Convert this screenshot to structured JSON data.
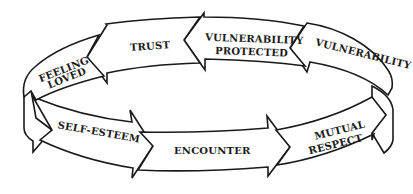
{
  "diagram": {
    "type": "cycle",
    "direction": "clockwise-loop",
    "stroke_color": "#1a1a1a",
    "fill_color": "#ffffff",
    "stages": [
      {
        "id": "vulnerability",
        "label": "VULNERABILITY",
        "band": "top",
        "arrow_direction": "left"
      },
      {
        "id": "vulnerability-protected",
        "label_line1": "VULNERABILITY",
        "label_line2": "PROTECTED",
        "band": "top",
        "arrow_direction": "left"
      },
      {
        "id": "trust",
        "label": "TRUST",
        "band": "top",
        "arrow_direction": "left"
      },
      {
        "id": "feeling-loved",
        "label_line1": "FEELING",
        "label_line2": "LOVED",
        "band": "top-left-turn",
        "arrow_direction": "left-down"
      },
      {
        "id": "self-esteem",
        "label": "SELF-ESTEEM",
        "band": "bottom",
        "arrow_direction": "right"
      },
      {
        "id": "encounter",
        "label": "ENCOUNTER",
        "band": "bottom",
        "arrow_direction": "right"
      },
      {
        "id": "mutual-respect",
        "label_line1": "MUTUAL",
        "label_line2": "RESPECT",
        "band": "bottom",
        "arrow_direction": "right-up"
      }
    ],
    "sequence": [
      "ENCOUNTER",
      "MUTUAL RESPECT",
      "VULNERABILITY",
      "VULNERABILITY PROTECTED",
      "TRUST",
      "FEELING LOVED",
      "SELF-ESTEEM"
    ]
  }
}
